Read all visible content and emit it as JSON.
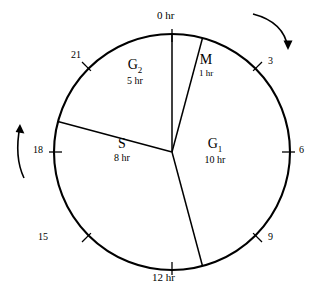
{
  "diagram": {
    "type": "cell-cycle-clock",
    "total_hours": 24,
    "center": {
      "x": 172,
      "y": 152
    },
    "radius": 118,
    "rotation_direction": "clockwise",
    "colors": {
      "stroke": "#000000",
      "background": "#ffffff"
    }
  },
  "hour_marks": [
    {
      "label": "0 hr",
      "hour": 0,
      "angle_deg": 0,
      "major": true
    },
    {
      "label": "3",
      "hour": 3,
      "angle_deg": 45,
      "major": false
    },
    {
      "label": "6",
      "hour": 6,
      "angle_deg": 90,
      "major": false
    },
    {
      "label": "9",
      "hour": 9,
      "angle_deg": 135,
      "major": false
    },
    {
      "label": "12 hr",
      "hour": 12,
      "angle_deg": 180,
      "major": true
    },
    {
      "label": "15",
      "hour": 15,
      "angle_deg": 225,
      "major": false
    },
    {
      "label": "18",
      "hour": 18,
      "angle_deg": 270,
      "major": false
    },
    {
      "label": "21",
      "hour": 21,
      "angle_deg": 315,
      "major": false
    }
  ],
  "phases": [
    {
      "key": "M",
      "name": "M",
      "subscript": "",
      "duration": "1 hr",
      "hours": 1,
      "start_hour": 0,
      "end_hour": 1
    },
    {
      "key": "G1",
      "name": "G",
      "subscript": "1",
      "duration": "10 hr",
      "hours": 10,
      "start_hour": 1,
      "end_hour": 11
    },
    {
      "key": "S",
      "name": "S",
      "subscript": "",
      "duration": "8 hr",
      "hours": 8,
      "start_hour": 11,
      "end_hour": 19
    },
    {
      "key": "G2",
      "name": "G",
      "subscript": "2",
      "duration": "5 hr",
      "hours": 5,
      "start_hour": 19,
      "end_hour": 24
    }
  ],
  "direction_arrows": [
    {
      "id": "top-right",
      "position": "upper-right",
      "points": "clockwise"
    },
    {
      "id": "left",
      "position": "mid-left",
      "points": "clockwise"
    }
  ]
}
